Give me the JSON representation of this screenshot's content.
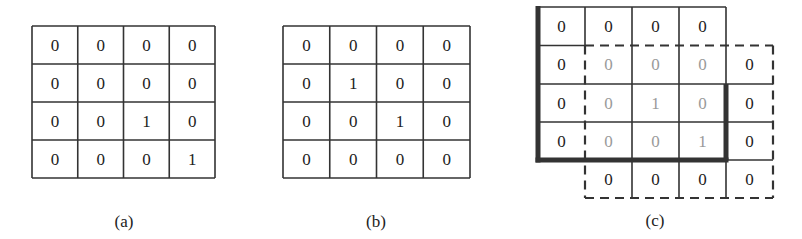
{
  "figure": {
    "panels": [
      {
        "id": "a",
        "caption": "(a)",
        "grid": [
          [
            0,
            0,
            0,
            0
          ],
          [
            0,
            0,
            0,
            0
          ],
          [
            0,
            0,
            1,
            0
          ],
          [
            0,
            0,
            0,
            1
          ]
        ]
      },
      {
        "id": "b",
        "caption": "(b)",
        "grid": [
          [
            0,
            0,
            0,
            0
          ],
          [
            0,
            1,
            0,
            0
          ],
          [
            0,
            0,
            1,
            0
          ],
          [
            0,
            0,
            0,
            0
          ]
        ]
      },
      {
        "id": "c",
        "caption": "(c)",
        "description": "Overlay of grid (a) (solid, thick-bordered) and grid (b) shifted one cell right and down (dashed); overlapping cells shown in gray",
        "rows": [
          [
            {
              "v": "0",
              "style": "solid"
            },
            {
              "v": "0",
              "style": "solid"
            },
            {
              "v": "0",
              "style": "solid"
            },
            {
              "v": "0",
              "style": "solid"
            },
            {
              "v": "",
              "style": "empty"
            }
          ],
          [
            {
              "v": "0",
              "style": "solid"
            },
            {
              "v": "0",
              "style": "overlap"
            },
            {
              "v": "0",
              "style": "overlap"
            },
            {
              "v": "0",
              "style": "overlap"
            },
            {
              "v": "0",
              "style": "dashed"
            }
          ],
          [
            {
              "v": "0",
              "style": "solid"
            },
            {
              "v": "0",
              "style": "overlap"
            },
            {
              "v": "1",
              "style": "overlap"
            },
            {
              "v": "0",
              "style": "overlap"
            },
            {
              "v": "0",
              "style": "dashed"
            }
          ],
          [
            {
              "v": "0",
              "style": "solid"
            },
            {
              "v": "0",
              "style": "overlap"
            },
            {
              "v": "0",
              "style": "overlap"
            },
            {
              "v": "1",
              "style": "overlap"
            },
            {
              "v": "0",
              "style": "dashed"
            }
          ],
          [
            {
              "v": "",
              "style": "empty"
            },
            {
              "v": "0",
              "style": "dashed"
            },
            {
              "v": "0",
              "style": "dashed"
            },
            {
              "v": "0",
              "style": "dashed"
            },
            {
              "v": "0",
              "style": "dashed"
            }
          ]
        ]
      }
    ],
    "colors": {
      "line": "#333333",
      "text": "#222222",
      "overlap_text": "#9a9a9a"
    }
  }
}
